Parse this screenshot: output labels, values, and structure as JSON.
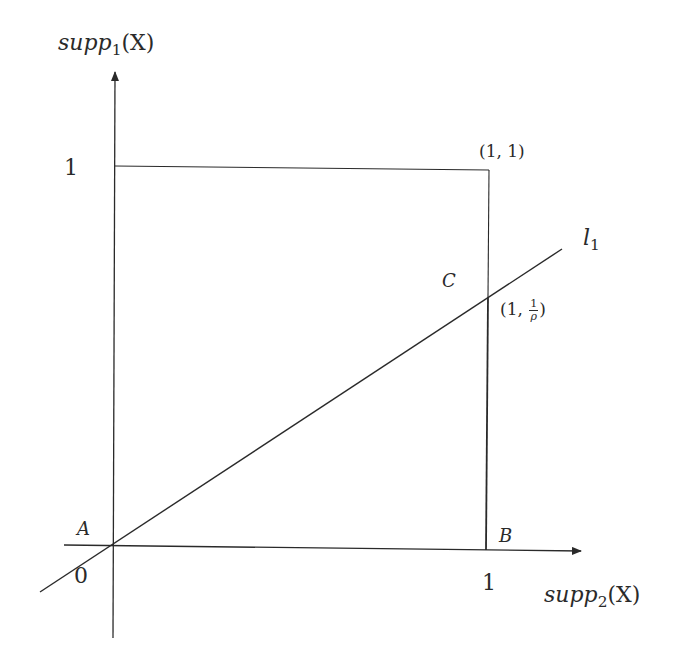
{
  "diagram": {
    "type": "geometric-plot",
    "axes": {
      "y_label_base": "supp",
      "y_label_sub": "1",
      "y_label_arg": "(X)",
      "x_label_base": "supp",
      "x_label_sub": "2",
      "x_label_arg": "(X)",
      "origin_label": "0",
      "y_tick_label": "1",
      "x_tick_label": "1"
    },
    "points": {
      "A": {
        "label": "A"
      },
      "B": {
        "label": "B"
      },
      "C": {
        "label": "C"
      },
      "corner": {
        "label": "(1, 1)"
      },
      "c_coord": {
        "prefix": "(1, ",
        "num": "1",
        "den": "ρ",
        "suffix": ")"
      }
    },
    "line": {
      "label_base": "l",
      "label_sub": "1"
    },
    "colors": {
      "stroke": "#2a2a2a",
      "background": "#ffffff"
    }
  }
}
